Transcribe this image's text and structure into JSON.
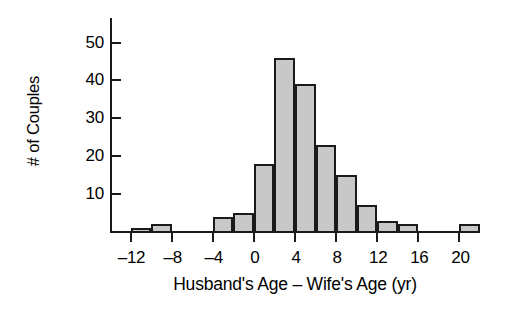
{
  "chart_data": {
    "type": "bar",
    "title": "",
    "subtitle": "",
    "xlabel": "Husband's Age – Wife's Age (yr)",
    "ylabel": "# of Couples",
    "xlim": [
      -14,
      22
    ],
    "ylim": [
      0,
      56.5
    ],
    "bin_width": 2,
    "grid": false,
    "legend": null,
    "bar_fill_color": "#c8c8c8",
    "bar_edge_color": "#1a1a1a",
    "background_color": "#ffffff",
    "x_tick_labels": [
      "–12",
      "–8",
      "–4",
      "0",
      "4",
      "8",
      "12",
      "16",
      "20"
    ],
    "x_tick_values": [
      -12,
      -8,
      -4,
      0,
      4,
      8,
      12,
      16,
      20
    ],
    "y_tick_labels": [
      "10",
      "20",
      "30",
      "40",
      "50"
    ],
    "y_tick_values": [
      10,
      20,
      30,
      40,
      50
    ],
    "categories": [
      "–12 to –10",
      "–10 to –8",
      "–8 to –6",
      "–6 to –4",
      "–4 to –2",
      "–2 to 0",
      "0 to 2",
      "2 to 4",
      "4 to 6",
      "6 to 8",
      "8 to 10",
      "10 to 12",
      "12 to 14",
      "14 to 16",
      "16 to 18",
      "18 to 20",
      "20 to 22"
    ],
    "bin_starts": [
      -12,
      -10,
      -8,
      -6,
      -4,
      -2,
      0,
      2,
      4,
      6,
      8,
      10,
      12,
      14,
      16,
      18,
      20
    ],
    "values": [
      1,
      2,
      0,
      0,
      4,
      5,
      18,
      46,
      39,
      23,
      15,
      7,
      3,
      2,
      0,
      0,
      2
    ]
  }
}
